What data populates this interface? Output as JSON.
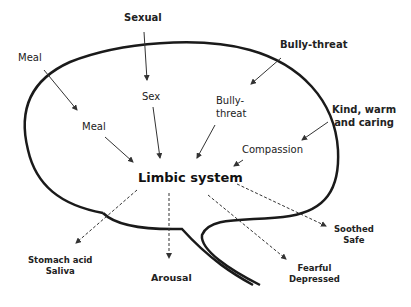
{
  "diagram": {
    "center": "Limbic system",
    "outer_inputs": [
      {
        "id": "sexual",
        "label": "Sexual"
      },
      {
        "id": "meal",
        "label": "Meal"
      },
      {
        "id": "bully_threat",
        "label": "Bully-threat"
      },
      {
        "id": "kind",
        "line1": "Kind, warm",
        "line2": "and caring"
      }
    ],
    "inner_inputs": [
      {
        "id": "sex",
        "label": "Sex"
      },
      {
        "id": "meal",
        "label": "Meal"
      },
      {
        "id": "bully_threat",
        "line1": "Bully-",
        "line2": "threat"
      },
      {
        "id": "compassion",
        "label": "Compassion"
      }
    ],
    "outputs": [
      {
        "id": "stomach",
        "line1": "Stomach acid",
        "line2": "Saliva"
      },
      {
        "id": "arousal",
        "label": "Arousal"
      },
      {
        "id": "fearful",
        "line1": "Fearful",
        "line2": "Depressed"
      },
      {
        "id": "soothed",
        "line1": "Soothed",
        "line2": "Safe"
      }
    ],
    "colors": {
      "line": "#1a1a1a",
      "text": "#222222",
      "background": "#ffffff"
    }
  }
}
